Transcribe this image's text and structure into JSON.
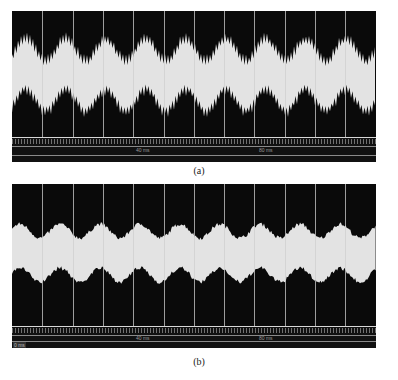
{
  "figure": {
    "panels": [
      {
        "id": "a",
        "caption": "(a)",
        "timeline_labels": [
          "40 ms",
          "80 ms"
        ],
        "origin_label": "",
        "waveform": "high-frequency carrier with strong periodic amplitude modulation, sharp comb-like edges",
        "gridline_count": 11
      },
      {
        "id": "b",
        "caption": "(b)",
        "timeline_labels": [
          "40 ms",
          "80 ms"
        ],
        "origin_label": "0 ms",
        "waveform": "high-frequency carrier with smoother, weaker periodic amplitude modulation",
        "gridline_count": 11
      }
    ]
  },
  "colors": {
    "background": "#0a0a0a",
    "signal": "#e6e6e6",
    "gridline": "#cfcfcf"
  }
}
